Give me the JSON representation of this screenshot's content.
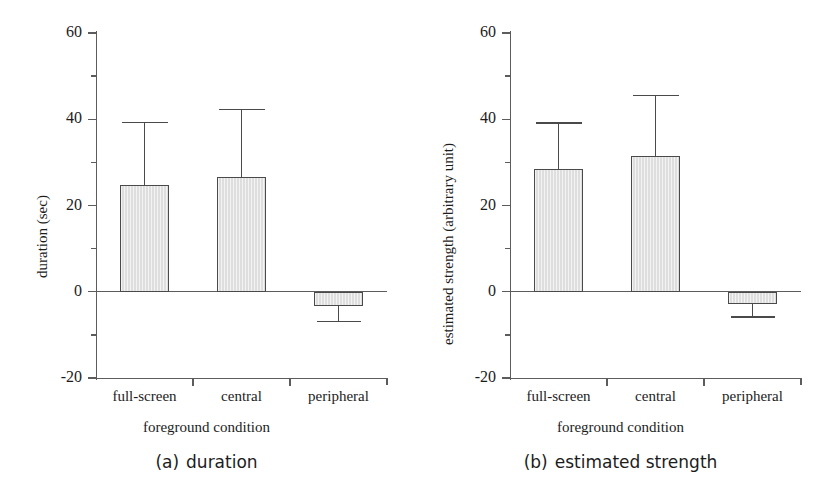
{
  "figure": {
    "panels": [
      {
        "id": "a",
        "caption_index": "(a)",
        "caption_text": "duration",
        "y_axis_title": "duration (sec)",
        "x_axis_title": "foreground condition",
        "y_ticks": [
          "60",
          "40",
          "20",
          "0",
          "-20"
        ]
      },
      {
        "id": "b",
        "caption_index": "(b)",
        "caption_text": "estimated strength",
        "y_axis_title": "estimated strength (arbitrary unit)",
        "x_axis_title": "foreground condition",
        "y_ticks": [
          "60",
          "40",
          "20",
          "0",
          "-20"
        ]
      }
    ]
  },
  "chart_data": [
    {
      "type": "bar",
      "title": "(a) duration",
      "xlabel": "foreground condition",
      "ylabel": "duration (sec)",
      "ylim": [
        -20,
        60
      ],
      "ytick_values": [
        -20,
        0,
        20,
        40,
        60
      ],
      "yminor_tick_values": [
        -10,
        10,
        30,
        50
      ],
      "grid": false,
      "legend": "none",
      "categories": [
        "full-screen",
        "central",
        "peripheral"
      ],
      "values": [
        24.8,
        26.6,
        -3.3
      ],
      "error_upper": [
        39.2,
        42.3,
        0
      ],
      "error_lower": [
        0,
        0,
        -6.9
      ],
      "error_type": "one-sided standard deviation"
    },
    {
      "type": "bar",
      "title": "(b) estimated strength",
      "xlabel": "foreground condition",
      "ylabel": "estimated strength (arbitrary unit)",
      "ylim": [
        -20,
        60
      ],
      "ytick_values": [
        -20,
        0,
        20,
        40,
        60
      ],
      "yminor_tick_values": [
        -10,
        10,
        30,
        50
      ],
      "grid": false,
      "legend": "none",
      "categories": [
        "full-screen",
        "central",
        "peripheral"
      ],
      "values": [
        28.4,
        31.4,
        -2.9
      ],
      "error_upper": [
        39.1,
        45.5,
        0
      ],
      "error_lower": [
        0,
        0,
        -5.9
      ],
      "error_type": "one-sided standard deviation"
    }
  ],
  "style": {
    "bar_fill": "#dedede",
    "bar_border": "#4a4a4a",
    "axis_color": "#5c5c5c",
    "text_color": "#1c1c1c",
    "background": "#ffffff"
  }
}
